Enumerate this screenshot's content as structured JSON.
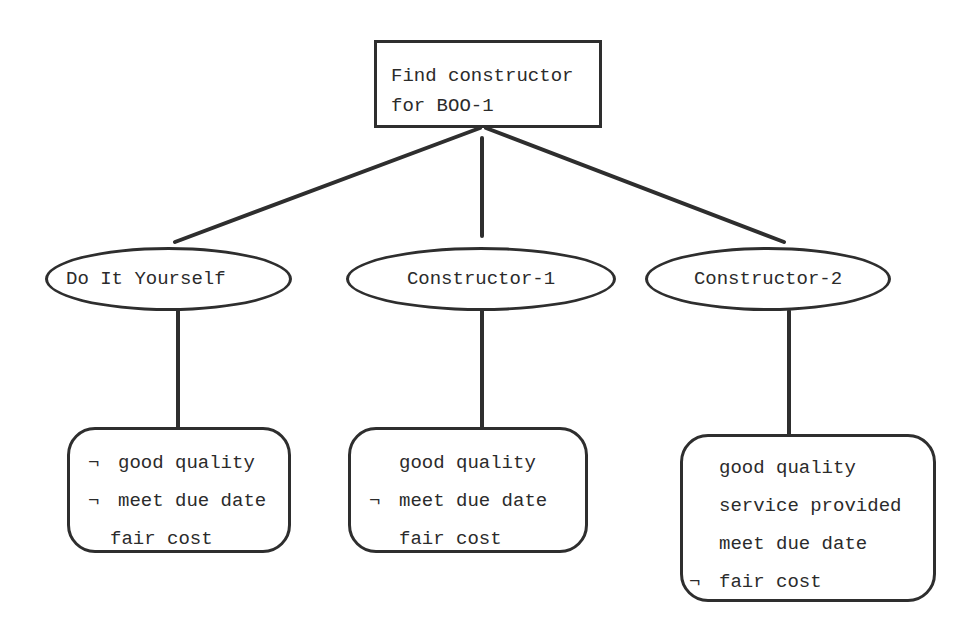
{
  "diagram": {
    "type": "tree",
    "root": {
      "label_line1": "Find constructor",
      "label_line2": "for BOO-1"
    },
    "options": [
      {
        "label": "Do It Yourself",
        "attributes": [
          {
            "neg": "¬",
            "text": "good quality"
          },
          {
            "neg": "¬",
            "text": "meet due date"
          },
          {
            "neg": "",
            "text": "fair cost"
          }
        ]
      },
      {
        "label": "Constructor-1",
        "attributes": [
          {
            "neg": "",
            "text": "good quality"
          },
          {
            "neg": "¬",
            "text": "meet due date"
          },
          {
            "neg": "",
            "text": "fair cost"
          }
        ]
      },
      {
        "label": "Constructor-2",
        "attributes": [
          {
            "neg": "",
            "text": "good quality"
          },
          {
            "neg": "",
            "text": "service provided"
          },
          {
            "neg": "",
            "text": "meet due date"
          },
          {
            "neg": "¬",
            "text": "fair cost"
          }
        ]
      }
    ],
    "colors": {
      "stroke": "#2e2e2e",
      "background": "#ffffff",
      "text": "#2b2b2b"
    }
  }
}
